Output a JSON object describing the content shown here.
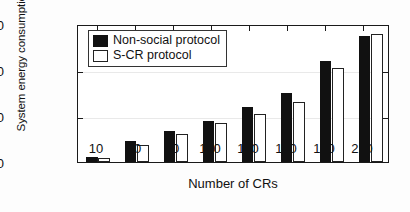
{
  "figure": {
    "kind": "grouped-bar-chart",
    "background": "#ffffff",
    "colors": {
      "non_social": "#111111",
      "s_cr": "#ffffff",
      "axis": "#1a1a1a",
      "grid": "#e9e9e9"
    }
  },
  "legend": {
    "position": "top-left-inside",
    "entries": [
      {
        "label": "Non-social protocol",
        "swatch": "filled-black-square",
        "icon": "legend-swatch-dark"
      },
      {
        "label": "S-CR protocol",
        "swatch": "open-white-square",
        "icon": "legend-swatch-light"
      }
    ]
  },
  "axes": {
    "y": {
      "label": "System energy consumption (J)",
      "ticks": [
        "0",
        "1000",
        "2000",
        "3000"
      ],
      "tick_values": [
        0,
        1000,
        2000,
        3000
      ],
      "min": 0,
      "max": 3000
    },
    "x": {
      "label": "Number of CRs",
      "ticks": [
        "10",
        "40",
        "70",
        "100",
        "130",
        "160",
        "190",
        "220"
      ]
    }
  },
  "chart_data": {
    "type": "bar",
    "title": "",
    "subtitle": "",
    "xlabel": "Number of CRs",
    "ylabel": "System energy consumption (J)",
    "categories": [
      "10",
      "40",
      "70",
      "100",
      "130",
      "160",
      "190",
      "220"
    ],
    "series": [
      {
        "name": "Non-social protocol",
        "color": "#111111",
        "values": [
          100,
          450,
          680,
          900,
          1200,
          1500,
          2200,
          2750
        ]
      },
      {
        "name": "S-CR protocol",
        "color": "#ffffff",
        "values": [
          80,
          380,
          600,
          850,
          1050,
          1300,
          2050,
          2780
        ]
      }
    ],
    "ylim": [
      0,
      3000
    ],
    "yticks": [
      0,
      1000,
      2000,
      3000
    ],
    "grid": true,
    "grid_axis": "y",
    "legend_position": "upper left",
    "annotations": []
  }
}
